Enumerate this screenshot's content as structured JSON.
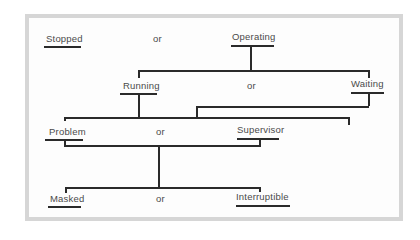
{
  "diagram": {
    "type": "state hierarchy tree",
    "levels": [
      {
        "left": "Stopped",
        "connector": "or",
        "right": "Operating"
      },
      {
        "left": "Running",
        "connector": "or",
        "right": "Waiting",
        "parent": "Operating"
      },
      {
        "left": "Problem",
        "connector": "or",
        "right": "Supervisor",
        "parent": "Running / Waiting"
      },
      {
        "left": "Masked",
        "connector": "or",
        "right": "Interruptible",
        "parent": "Problem / Supervisor"
      }
    ]
  },
  "labels": {
    "stopped": "Stopped",
    "operating": "Operating",
    "running": "Running",
    "waiting": "Waiting",
    "problem": "Problem",
    "supervisor": "Supervisor",
    "masked": "Masked",
    "interruptible": "Interruptible",
    "or": "or"
  },
  "colors": {
    "frame": "#d6d6d6",
    "line": "#2a2a2a",
    "text": "#4a4a4a"
  }
}
